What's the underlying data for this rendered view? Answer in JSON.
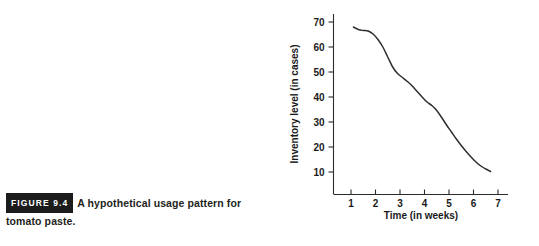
{
  "figure": {
    "badge": "FIGURE 9.4",
    "caption": "A hypothetical usage pattern for tomato paste."
  },
  "chart_data": {
    "type": "line",
    "title": "",
    "xlabel": "Time (in weeks)",
    "ylabel": "Inventory level (in cases)",
    "xlim": [
      0,
      7.6
    ],
    "ylim": [
      0,
      76
    ],
    "xticks": [
      1,
      2,
      3,
      4,
      5,
      6,
      7
    ],
    "xtick_labels": [
      "1",
      "2",
      "3",
      "4",
      "5",
      "6",
      "7"
    ],
    "yticks": [
      10,
      20,
      30,
      40,
      50,
      60,
      70
    ],
    "ytick_labels": [
      "10",
      "20",
      "30",
      "40",
      "50",
      "60",
      "70"
    ],
    "grid": false,
    "legend": null,
    "series": [
      {
        "name": "Inventory level",
        "color": "#2f2f2f",
        "x": [
          1.1,
          1.3,
          1.5,
          1.7,
          1.9,
          2.1,
          2.3,
          2.5,
          2.7,
          2.9,
          3.1,
          3.3,
          3.5,
          3.7,
          3.9,
          4.1,
          4.3,
          4.5,
          4.7,
          4.9,
          5.1,
          5.3,
          5.5,
          5.7,
          5.9,
          6.1,
          6.3,
          6.5,
          6.7
        ],
        "y": [
          68.0,
          67.0,
          66.6,
          66.4,
          65.2,
          63.0,
          60.0,
          56.0,
          52.0,
          49.4,
          47.8,
          46.2,
          44.4,
          42.2,
          40.0,
          38.0,
          36.6,
          34.6,
          31.8,
          28.8,
          26.0,
          23.2,
          20.6,
          18.2,
          16.0,
          14.0,
          12.4,
          11.2,
          10.2
        ]
      }
    ]
  },
  "axis_labels": {
    "x_axis_title": "Time (in weeks)",
    "y_axis_title": "Inventory level (in cases)"
  }
}
